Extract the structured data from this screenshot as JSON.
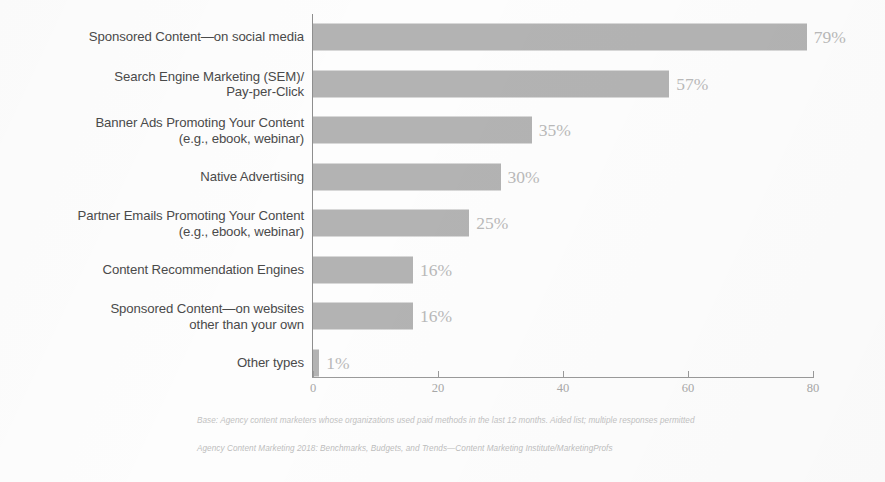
{
  "chart_data": {
    "type": "bar",
    "orientation": "horizontal",
    "title": "",
    "xlabel": "",
    "ylabel": "",
    "xlim": [
      0,
      80
    ],
    "xticks": [
      "0",
      "20",
      "40",
      "60",
      "80"
    ],
    "grid": false,
    "legend": null,
    "bar_color": "#b3b3b3",
    "label_color": "#b9b9b9",
    "categories": [
      "Sponsored Content—on social media",
      "Search Engine Marketing (SEM)/\nPay-per-Click",
      "Banner Ads Promoting Your Content\n(e.g., ebook, webinar)",
      "Native Advertising",
      "Partner Emails Promoting Your Content\n(e.g., ebook, webinar)",
      "Content Recommendation Engines",
      "Sponsored Content—on websites\nother than your own",
      "Other types"
    ],
    "values": [
      79,
      57,
      35,
      30,
      25,
      16,
      16,
      1
    ],
    "value_labels": [
      "79%",
      "57%",
      "35%",
      "30%",
      "25%",
      "16%",
      "16%",
      "1%"
    ]
  },
  "footnotes": {
    "base": "Base: Agency content marketers whose organizations used paid methods in the last 12 months. Aided list; multiple responses permitted",
    "source": "Agency Content Marketing 2018: Benchmarks, Budgets, and Trends—Content Marketing Institute/MarketingProfs"
  }
}
